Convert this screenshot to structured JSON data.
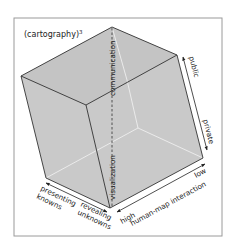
{
  "diagram": {
    "title": "(cartography)",
    "title_superscript": "3",
    "colors": {
      "background": "#ffffff",
      "frame": "#9a9a9a",
      "cube_fill": "#c9c9c9",
      "cube_fill_top": "#c4c4c4",
      "edge": "#333333",
      "hidden_edge": "#eeeeee",
      "text": "#222222"
    },
    "vertical_axis": {
      "upper_label": "communication",
      "lower_label": "visualization"
    },
    "right_axis": {
      "start_label": "public",
      "end_label": "private"
    },
    "bottom_right_axis": {
      "title": "human-map interaction",
      "start_label": "high",
      "end_label": "low"
    },
    "bottom_left_axis": {
      "start_label_line1": "presenting",
      "start_label_line2": "knowns",
      "end_label_line1": "revealing",
      "end_label_line2": "unknowns"
    }
  }
}
